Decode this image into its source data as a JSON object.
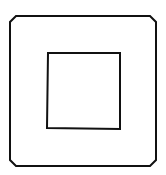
{
  "figure": {
    "width": 166,
    "height": 175,
    "background": "#ffffff",
    "stroke_color": "#111111",
    "outer_frame": {
      "shape": "chamfered-square",
      "points": "16,16 150,16 156,22 156,160 150,166 16,166 10,160 10,22",
      "stroke_width": 2
    },
    "inner_square": {
      "shape": "square",
      "points": "48,53 120,53 120,129 47,128",
      "stroke_width": 2
    }
  }
}
